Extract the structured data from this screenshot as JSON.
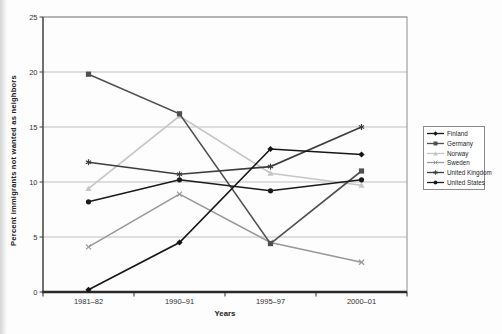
{
  "chart_data": {
    "type": "line",
    "categories": [
      "1981–82",
      "1990–91",
      "1995–97",
      "2000–01"
    ],
    "series": [
      {
        "name": "Finland",
        "color": "#161616",
        "marker": "diamond",
        "values": [
          0.2,
          4.5,
          13.0,
          12.5
        ]
      },
      {
        "name": "Germany",
        "color": "#4f4f4f",
        "marker": "square",
        "values": [
          19.8,
          16.2,
          4.4,
          11.0
        ]
      },
      {
        "name": "Norway",
        "color": "#c6c6c6",
        "marker": "triangle",
        "values": [
          9.4,
          16.0,
          10.8,
          9.7
        ]
      },
      {
        "name": "Sweden",
        "color": "#999999",
        "marker": "x",
        "values": [
          4.1,
          8.9,
          4.5,
          2.7
        ]
      },
      {
        "name": "United Kingdom",
        "color": "#3d3d3d",
        "marker": "asterisk",
        "values": [
          11.8,
          10.7,
          11.4,
          15.0
        ]
      },
      {
        "name": "United States",
        "color": "#1b1b1b",
        "marker": "circle",
        "values": [
          8.2,
          10.2,
          9.2,
          10.2
        ]
      }
    ],
    "title": "",
    "xlabel": "Years",
    "ylabel": "Percent immigrants not wanted as neighbors",
    "ylim": [
      0,
      25
    ],
    "yticks": [
      0,
      5,
      10,
      15,
      20,
      25
    ],
    "grid": true,
    "legend_position": "right",
    "gridline_color": "#bfbfbf",
    "frame_color": "#8c8c8c",
    "axis_color": "#2a2a2a",
    "tick_label_color": "#333333"
  }
}
